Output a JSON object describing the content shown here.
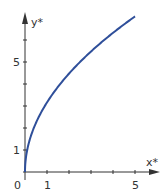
{
  "chart_data": {
    "type": "line",
    "title": "",
    "xlabel": "x*",
    "ylabel": "y*",
    "xlim": [
      0,
      5.5
    ],
    "ylim": [
      0,
      7.5
    ],
    "x_ticks": [
      1,
      2,
      3,
      4,
      5
    ],
    "x_tick_labels": [
      "1",
      "5"
    ],
    "y_ticks": [
      1,
      2,
      3,
      4,
      5,
      6
    ],
    "y_tick_labels": [
      "1",
      "5"
    ],
    "origin_label": "0",
    "grid": false,
    "legend": null,
    "series": [
      {
        "name": "y* = sqrt(10 x*)",
        "color": "#2f4f9a",
        "x": [
          0,
          0.02,
          0.1,
          0.25,
          0.5,
          1,
          1.5,
          2,
          2.5,
          3,
          3.5,
          4,
          4.5,
          5
        ],
        "y": [
          0,
          0.45,
          1.0,
          1.58,
          2.24,
          3.16,
          3.87,
          4.47,
          5.0,
          5.48,
          5.92,
          6.32,
          6.71,
          7.07
        ]
      }
    ]
  },
  "labels": {
    "x_axis": "x*",
    "y_axis": "y*",
    "origin": "0",
    "x1": "1",
    "x5": "5",
    "y1": "1",
    "y5": "5"
  },
  "colors": {
    "axis": "#333333",
    "curve": "#2f4f9a"
  }
}
